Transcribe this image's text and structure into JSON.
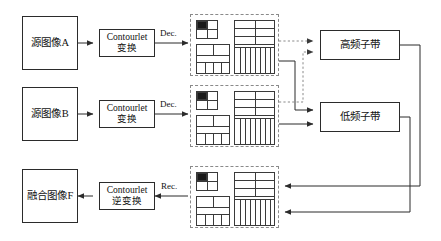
{
  "diagram": {
    "nodes": {
      "source_a": "源图像A",
      "source_b": "源图像B",
      "fused_f": "融合图像F",
      "transform_line1": "Contourlet",
      "transform_line2": "变换",
      "inverse_line1": "Contourlet",
      "inverse_line2": "逆变换",
      "high_subband": "高频子带",
      "low_subband": "低频子带"
    },
    "edge_labels": {
      "dec_a": "Dec.",
      "dec_b": "Dec.",
      "rec": "Rec."
    },
    "colors": {
      "stroke": "#2b2b2b",
      "grid_stroke": "#3a3a3a",
      "dashed_stroke": "#8a8a8a",
      "fill": "#ffffff",
      "black_cell": "#1a1a1a",
      "text": "#111111"
    },
    "decomposition_panels": [
      {
        "name": "decomp-panel-a",
        "black_cell": "top-left"
      },
      {
        "name": "decomp-panel-b",
        "black_cell": "top-left"
      },
      {
        "name": "decomp-panel-fused",
        "black_cell": "top-left"
      }
    ]
  }
}
